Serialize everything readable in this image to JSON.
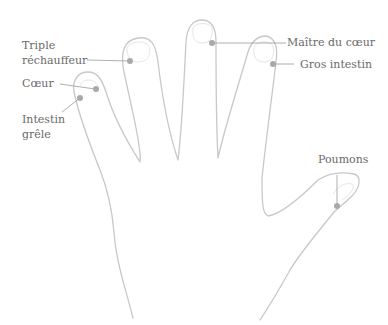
{
  "diagram": {
    "labels": {
      "triple_rechauffeur": "Triple\nréchauffeur",
      "coeur": "Cœur",
      "intestin_grele": "Intestin\ngrêle",
      "maitre_du_coeur": "Maître du cœur",
      "gros_intestin": "Gros intestin",
      "poumons": "Poumons"
    },
    "colors": {
      "outline": "#c8c8c8",
      "nail": "#e6e6e6",
      "dot": "#a9a9a9",
      "leader": "#9a9a9a",
      "text": "#6a6a6a"
    }
  }
}
